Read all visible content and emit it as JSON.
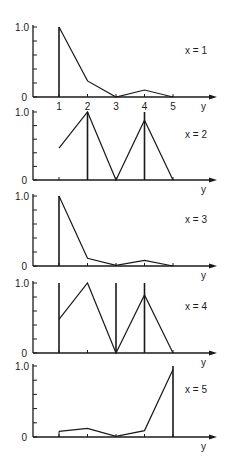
{
  "chart_data": [
    {
      "type": "line",
      "panel_label": "x = 1",
      "x": [
        1,
        2,
        3,
        4,
        5
      ],
      "values": [
        1.0,
        0.23,
        0.0,
        0.1,
        0.0
      ],
      "stems_at": [
        1
      ],
      "xlabel": "y",
      "yticks": [
        "0",
        "1.0"
      ],
      "xticks": [
        "1",
        "2",
        "3",
        "4",
        "5"
      ],
      "ylim": [
        0,
        1.0
      ]
    },
    {
      "type": "line",
      "panel_label": "x = 2",
      "x": [
        1,
        2,
        3,
        4,
        5
      ],
      "values": [
        0.47,
        1.0,
        0.0,
        0.88,
        0.0
      ],
      "stems_at": [
        2,
        4
      ],
      "xlabel": "y",
      "yticks": [
        "0",
        "1.0"
      ],
      "ylim": [
        0,
        1.0
      ]
    },
    {
      "type": "line",
      "panel_label": "x = 3",
      "x": [
        1,
        2,
        3,
        4,
        5
      ],
      "values": [
        1.0,
        0.11,
        0.01,
        0.08,
        0.0
      ],
      "stems_at": [
        1
      ],
      "xlabel": "y",
      "yticks": [
        "0",
        "1.0"
      ],
      "ylim": [
        0,
        1.0
      ]
    },
    {
      "type": "line",
      "panel_label": "x = 4",
      "x": [
        1,
        2,
        3,
        4,
        5
      ],
      "values": [
        0.48,
        1.0,
        0.0,
        0.83,
        0.0
      ],
      "stems_at": [
        1,
        3,
        4
      ],
      "xlabel": "y",
      "yticks": [
        "0",
        "1.0"
      ],
      "ylim": [
        0,
        1.0
      ]
    },
    {
      "type": "line",
      "panel_label": "x = 5",
      "x": [
        1,
        2,
        3,
        4,
        5
      ],
      "values": [
        0.08,
        0.12,
        0.01,
        0.09,
        0.95
      ],
      "stems_at": [
        5
      ],
      "xlabel": "y",
      "yticks": [
        "0",
        "1.0"
      ],
      "ylim": [
        0,
        1.0
      ]
    }
  ]
}
